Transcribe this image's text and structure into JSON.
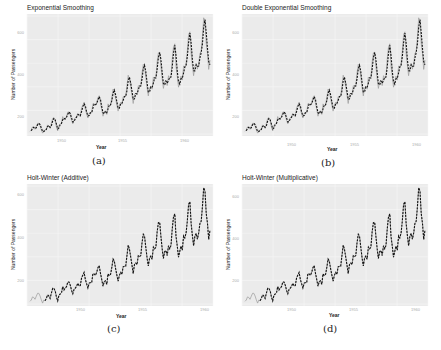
{
  "chart_data": [
    {
      "type": "line",
      "subfigure": "(a)",
      "title": "Exponential Smoothing",
      "xlabel": "Year",
      "ylabel": "Number of Passengers",
      "xticks": [
        "1950",
        "1955",
        "1960"
      ],
      "yticks": [
        "200",
        "400",
        "600"
      ],
      "xlim": [
        1949,
        1961
      ],
      "ylim": [
        100,
        650
      ],
      "grid": true,
      "series": [
        {
          "name": "Actual",
          "style": "solid-gray"
        },
        {
          "name": "Fitted",
          "style": "dashed-black"
        }
      ]
    },
    {
      "type": "line",
      "subfigure": "(b)",
      "title": "Double Exponential Smoothing",
      "xlabel": "Year",
      "ylabel": "Number of Passengers",
      "xticks": [
        "1950",
        "1955",
        "1960"
      ],
      "yticks": [
        "200",
        "400",
        "600"
      ],
      "xlim": [
        1949,
        1961
      ],
      "ylim": [
        100,
        650
      ],
      "grid": true,
      "series": [
        {
          "name": "Actual",
          "style": "solid-gray"
        },
        {
          "name": "Fitted",
          "style": "dashed-black"
        }
      ]
    },
    {
      "type": "line",
      "subfigure": "(c)",
      "title": "Holt-Winter (Additive)",
      "xlabel": "Year",
      "ylabel": "Number of Passengers",
      "xticks": [
        "1950",
        "1955",
        "1960"
      ],
      "yticks": [
        "200",
        "400",
        "600"
      ],
      "xlim": [
        1949,
        1961
      ],
      "ylim": [
        100,
        650
      ],
      "grid": true,
      "series": [
        {
          "name": "Actual",
          "style": "solid-gray"
        },
        {
          "name": "Fitted",
          "style": "dashed-black"
        }
      ]
    },
    {
      "type": "line",
      "subfigure": "(d)",
      "title": "Holt-Winter (Multiplicative)",
      "xlabel": "Year",
      "ylabel": "Number of Passengers",
      "xticks": [
        "1950",
        "1955",
        "1960"
      ],
      "yticks": [
        "200",
        "400",
        "600"
      ],
      "xlim": [
        1949,
        1961
      ],
      "ylim": [
        100,
        650
      ],
      "grid": true,
      "series": [
        {
          "name": "Actual",
          "style": "solid-gray"
        },
        {
          "name": "Fitted",
          "style": "dashed-black"
        }
      ]
    }
  ],
  "panels": [
    {
      "title": "Exponential Smoothing",
      "sub": "(a)"
    },
    {
      "title": "Double Exponential Smoothing",
      "sub": "(b)"
    },
    {
      "title": "Holt-Winter (Additive)",
      "sub": "(c)"
    },
    {
      "title": "Holt-Winter (Multiplicative)",
      "sub": "(d)"
    }
  ],
  "axis": {
    "xlabel": "Year",
    "ylabel": "Number of Passengers",
    "xticks": [
      "1950",
      "1955",
      "1960"
    ],
    "yticks": [
      "600",
      "400",
      "200"
    ]
  }
}
